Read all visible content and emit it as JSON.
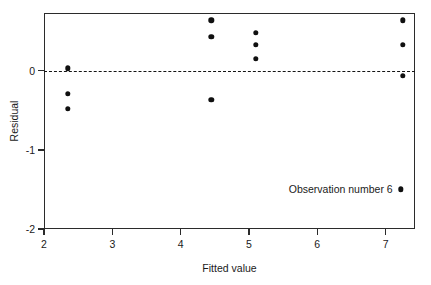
{
  "chart_data": {
    "type": "scatter",
    "title": "",
    "xlabel": "Fitted value",
    "ylabel": "Residual",
    "xlim": [
      2.0,
      7.43
    ],
    "ylim": [
      -2.0,
      0.73
    ],
    "xticks": [
      2,
      3,
      4,
      5,
      6,
      7
    ],
    "xtick_labels": [
      "2",
      "3",
      "4",
      "5",
      "6",
      "7"
    ],
    "yticks": [
      0,
      -1,
      -2
    ],
    "ytick_labels": [
      "0",
      "-1",
      "-2"
    ],
    "grid": false,
    "legend": "none",
    "reference_line": {
      "type": "horizontal-dashed",
      "y": 0.0,
      "style": "dashed",
      "color": "#141414"
    },
    "points": [
      {
        "x": 2.35,
        "y": 0.03
      },
      {
        "x": 2.35,
        "y": -0.29
      },
      {
        "x": 2.35,
        "y": -0.48
      },
      {
        "x": 4.45,
        "y": 0.64
      },
      {
        "x": 4.45,
        "y": 0.43
      },
      {
        "x": 4.45,
        "y": -0.37
      },
      {
        "x": 5.1,
        "y": 0.48
      },
      {
        "x": 5.1,
        "y": 0.33
      },
      {
        "x": 5.1,
        "y": 0.15
      },
      {
        "x": 7.25,
        "y": 0.64
      },
      {
        "x": 7.25,
        "y": 0.33
      },
      {
        "x": 7.25,
        "y": -0.06
      }
    ],
    "annotations": [
      {
        "text": "Observation number 6",
        "marker": true,
        "x": 7.22,
        "y": -1.5
      }
    ],
    "marker_color": "#101010",
    "axis_color": "#2b2b2b",
    "background": "#ffffff"
  }
}
